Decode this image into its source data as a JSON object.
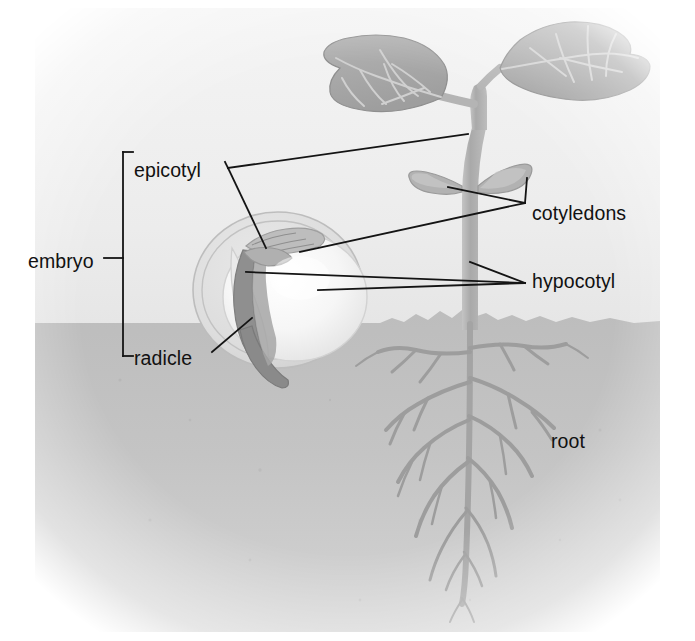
{
  "diagram": {
    "labels": [
      {
        "id": "embryo",
        "text": "embryo",
        "x": 28,
        "y": 252,
        "anchor": "left"
      },
      {
        "id": "epicotyl",
        "text": "epicotyl",
        "x": 134,
        "y": 161,
        "anchor": "left"
      },
      {
        "id": "radicle",
        "text": "radicle",
        "x": 134,
        "y": 349,
        "anchor": "left"
      },
      {
        "id": "cotyledons",
        "text": "cotyledons",
        "x": 532,
        "y": 204,
        "anchor": "left"
      },
      {
        "id": "hypocotyl",
        "text": "hypocotyl",
        "x": 532,
        "y": 272,
        "anchor": "left"
      },
      {
        "id": "root",
        "text": "root",
        "x": 551,
        "y": 432,
        "anchor": "left"
      }
    ],
    "colors": {
      "background": "#ffffff",
      "sky": "#eeeeee",
      "soil": "#b8b8b8",
      "soil_deep": "#c9c9c9",
      "plant": "#b0b0b0",
      "leaf": "#a8a8a8",
      "leaf_dark": "#9a9a9a",
      "seed_coat": "#d9d9d9",
      "cotyledon_seed": "#f2f2f2",
      "embryo_axis": "#8f8f8f",
      "root_color": "#9d9d9d",
      "label_text": "#111111",
      "leader_line": "#141414"
    },
    "scene": {
      "soil_line_y": 323,
      "parts": [
        "true-leaves",
        "stem",
        "seedling-cotyledons",
        "hypocotyl-stem",
        "taproot",
        "lateral-roots",
        "seed-coat",
        "seed-cotyledon",
        "seed-epicotyl",
        "seed-radicle"
      ]
    }
  }
}
